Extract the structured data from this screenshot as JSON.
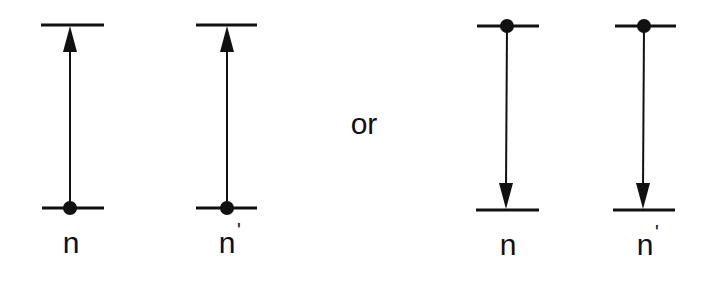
{
  "diagrams": [
    {
      "id": "up-n",
      "direction": "up",
      "label": "n",
      "prime": ""
    },
    {
      "id": "up-n-prime",
      "direction": "up",
      "label": "n",
      "prime": "'"
    },
    {
      "id": "down-n",
      "direction": "down",
      "label": "n",
      "prime": ""
    },
    {
      "id": "down-n-prime",
      "direction": "down",
      "label": "n",
      "prime": "'"
    }
  ],
  "connector": "or",
  "colors": {
    "ink": "#111111",
    "background": "#ffffff"
  }
}
